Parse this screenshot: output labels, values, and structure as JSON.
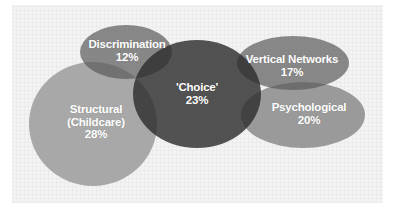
{
  "diagram": {
    "type": "overlapping-bubble-diagram",
    "background_color": "#f3f3f3",
    "nodes": [
      {
        "id": "structural",
        "name": "Structural",
        "sub": "(Childcare)",
        "value": "28%",
        "color": "#a8a8a8",
        "shape": {
          "cx": 93,
          "cy": 124,
          "rx": 64,
          "ry": 62
        }
      },
      {
        "id": "discrimination",
        "name": "Discrimination",
        "value": "12%",
        "color": "#868686",
        "shape": {
          "cx": 126,
          "cy": 52,
          "rx": 46,
          "ry": 27
        }
      },
      {
        "id": "choice",
        "name": "'Choice'",
        "value": "23%",
        "color": "#4b4b4b",
        "shape": {
          "cx": 197,
          "cy": 94,
          "rx": 64,
          "ry": 54
        }
      },
      {
        "id": "vertical-networks",
        "name": "Vertical Networks",
        "value": "17%",
        "color": "#868686",
        "shape": {
          "cx": 293,
          "cy": 63,
          "rx": 56,
          "ry": 27
        }
      },
      {
        "id": "psychological",
        "name": "Psychological",
        "value": "20%",
        "color": "#9a9a9a",
        "shape": {
          "cx": 303,
          "cy": 115,
          "rx": 62,
          "ry": 33
        }
      }
    ]
  }
}
